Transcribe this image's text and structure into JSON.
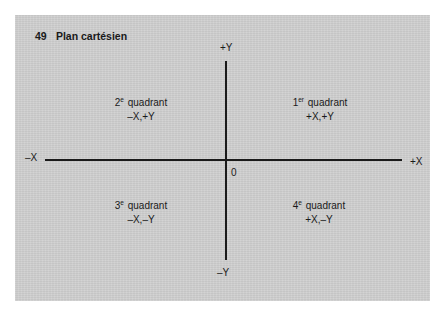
{
  "figure": {
    "number": "49",
    "title": "Plan cartésien"
  },
  "axes": {
    "x_positive": "+X",
    "x_negative": "–X",
    "y_positive": "+Y",
    "y_negative": "–Y",
    "origin": "0"
  },
  "quadrants": [
    {
      "ordinal_number": "1",
      "ordinal_suffix": "er",
      "word": "quadrant",
      "signs": "+X,+Y"
    },
    {
      "ordinal_number": "2",
      "ordinal_suffix": "e",
      "word": "quadrant",
      "signs": "–X,+Y"
    },
    {
      "ordinal_number": "3",
      "ordinal_suffix": "e",
      "word": "quadrant",
      "signs": "–X,–Y"
    },
    {
      "ordinal_number": "4",
      "ordinal_suffix": "e",
      "word": "quadrant",
      "signs": "+X,–Y"
    }
  ],
  "colors": {
    "panel_background": "#d0d0d0",
    "ink": "#1a1a1a",
    "page_background": "#ffffff"
  }
}
